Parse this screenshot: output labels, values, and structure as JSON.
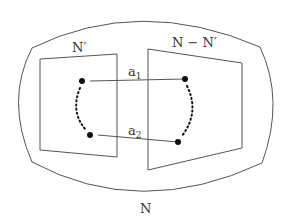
{
  "labels": {
    "outer": "N",
    "left_region": "N′",
    "right_region": "N − N′",
    "arc1": "a",
    "arc1_sub": "1",
    "arc2": "a",
    "arc2_sub": "2"
  },
  "colors": {
    "stroke": "#555555",
    "dot": "#111111",
    "text": "#333333"
  }
}
